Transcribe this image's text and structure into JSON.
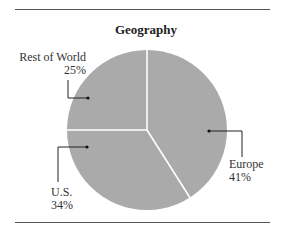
{
  "chart_data": {
    "type": "pie",
    "title": "Geography",
    "categories": [
      "Europe",
      "U.S.",
      "Rest of World"
    ],
    "values": [
      41,
      34,
      25
    ],
    "unit": "%",
    "start_angle": "12 o'clock, clockwise",
    "colors": {
      "slice_fill": "#aaaaaa",
      "divider": "#ffffff",
      "leader": "#222222"
    },
    "legend": "none (direct labels with leader lines)"
  },
  "labels": {
    "europe": {
      "name": "Europe",
      "pct": "41%"
    },
    "us": {
      "name": "U.S.",
      "pct": "34%"
    },
    "row": {
      "name": "Rest of World",
      "pct": "25%"
    }
  },
  "title": "Geography"
}
